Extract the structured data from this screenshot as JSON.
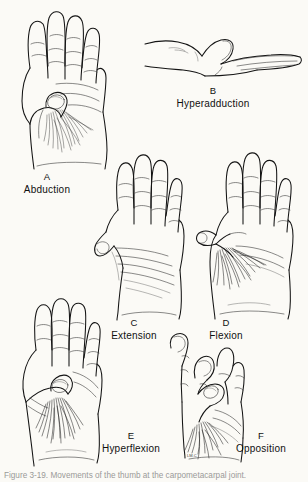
{
  "figure": {
    "background_color": "#fbfaf6",
    "ink_color": "#141414",
    "type": "anatomical line-drawing plate",
    "subject": "Movements of the thumb",
    "panel_count": 6,
    "bottom_caption": "Figure 3-19.  Movements of the thumb at the carpometacarpal joint.",
    "artist_signature": "LM.C"
  },
  "panels": [
    {
      "letter": "A",
      "term": "Abduction",
      "view": "palmar view of right hand, thumb drawn forward away from palm",
      "letter_x": 46,
      "letter_y": 178,
      "term_x": 46,
      "term_y": 189
    },
    {
      "letter": "B",
      "term": "Hyperadduction",
      "view": "lateral view of hand, thumb crossed tightly against palm",
      "letter_x": 213,
      "letter_y": 92,
      "term_x": 213,
      "term_y": 103
    },
    {
      "letter": "C",
      "term": "Extension",
      "view": "palmar view, thumb extended laterally in plane of palm",
      "letter_x": 134,
      "letter_y": 324,
      "term_x": 134,
      "term_y": 335
    },
    {
      "letter": "D",
      "term": "Flexion",
      "view": "palmar view, thumb flexed across palm",
      "letter_x": 226,
      "letter_y": 324,
      "term_x": 226,
      "term_y": 335
    },
    {
      "letter": "E",
      "term": "Hyperflexion",
      "view": "palmar view, thumb folded fully across palm",
      "letter_x": 131,
      "letter_y": 437,
      "term_x": 131,
      "term_y": 448
    },
    {
      "letter": "F",
      "term": "Opposition",
      "view": "palmar view, thumb tip touching tip of middle finger",
      "letter_x": 262,
      "letter_y": 437,
      "term_x": 262,
      "term_y": 448
    }
  ]
}
